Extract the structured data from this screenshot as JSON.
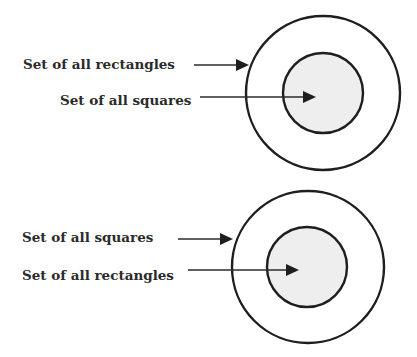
{
  "diagrams": [
    {
      "name": "rectangles-contain-squares",
      "outer_label": "Set of all rectangles",
      "inner_label": "Set of all squares",
      "outer_circle": {
        "cx": 323,
        "cy": 93,
        "r": 77
      },
      "inner_circle": {
        "cx": 323,
        "cy": 93,
        "r": 40
      },
      "inner_fill": "#eeeeee"
    },
    {
      "name": "squares-contain-rectangles",
      "outer_label": "Set of all squares",
      "inner_label": "Set of all rectangles",
      "outer_circle": {
        "cx": 308,
        "cy": 267,
        "r": 76
      },
      "inner_circle": {
        "cx": 307,
        "cy": 267,
        "r": 40
      },
      "inner_fill": "#eeeeee"
    }
  ]
}
